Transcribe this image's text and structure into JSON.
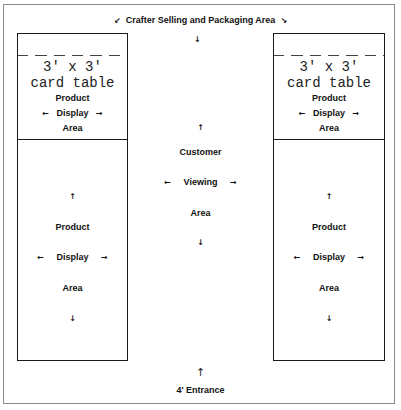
{
  "title": {
    "left_arrow": "↙",
    "text": "Crafter Selling and Packaging Area",
    "right_arrow": "↘"
  },
  "top_center_arrow": "↓",
  "tables": [
    {
      "size": "3' x 3'",
      "name": "card table",
      "upper_area": {
        "line1": "Product",
        "line2": "Display",
        "line3": "Area",
        "left_arrow": "←",
        "right_arrow": "→"
      },
      "lower_area": {
        "up_arrow": "↑",
        "line1": "Product",
        "line2": "Display",
        "line3": "Area",
        "left_arrow": "←",
        "right_arrow": "→",
        "down_arrow": "↓"
      }
    },
    {
      "size": "3' x 3'",
      "name": "card table",
      "upper_area": {
        "line1": "Product",
        "line2": "Display",
        "line3": "Area",
        "left_arrow": "←",
        "right_arrow": "→"
      },
      "lower_area": {
        "up_arrow": "↑",
        "line1": "Product",
        "line2": "Display",
        "line3": "Area",
        "left_arrow": "←",
        "right_arrow": "→",
        "down_arrow": "↓"
      }
    }
  ],
  "customer_area": {
    "up_arrow": "↑",
    "line1": "Customer",
    "line2": "Viewing",
    "line3": "Area",
    "left_arrow": "←",
    "right_arrow": "→",
    "down_arrow": "↓"
  },
  "entrance": {
    "arrow": "↑",
    "label": "4' Entrance"
  }
}
